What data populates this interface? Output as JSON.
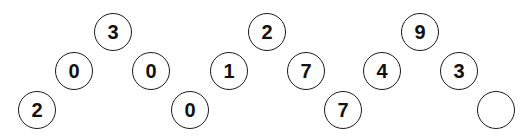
{
  "puzzle": {
    "groups": [
      {
        "top": "3",
        "mid_left": "0",
        "mid_right": "0",
        "bottom_left": "2",
        "bottom_right": "0"
      },
      {
        "top": "2",
        "mid_left": "1",
        "mid_right": "7",
        "bottom_left": "0",
        "bottom_right": "7"
      },
      {
        "top": "9",
        "mid_left": "4",
        "mid_right": "3",
        "bottom_left": "7",
        "bottom_right": ""
      }
    ]
  }
}
